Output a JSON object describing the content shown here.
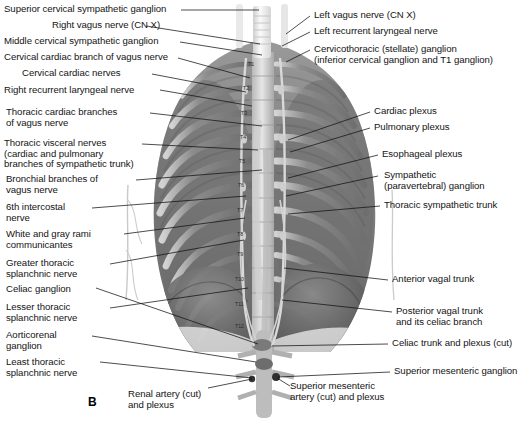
{
  "figure": {
    "panel_label": "B",
    "background_color": "#ffffff",
    "ink_color": "#141414",
    "art_type": "grayscale-anatomical-illustration"
  },
  "labels_left": [
    {
      "id": "superior-cervical-sympathetic-ganglion",
      "lines": [
        "Superior cervical sympathetic ganglion"
      ]
    },
    {
      "id": "right-vagus-nerve",
      "lines": [
        "Right vagus nerve (CN X)"
      ]
    },
    {
      "id": "middle-cervical-sympathetic-ganglion",
      "lines": [
        "Middle cervical sympathetic ganglion"
      ]
    },
    {
      "id": "cervical-cardiac-branch-of-vagus-nerve",
      "lines": [
        "Cervical cardiac branch of vagus nerve"
      ]
    },
    {
      "id": "cervical-cardiac-nerves",
      "lines": [
        "Cervical cardiac nerves"
      ]
    },
    {
      "id": "right-recurrent-laryngeal-nerve",
      "lines": [
        "Right recurrent laryngeal nerve"
      ]
    },
    {
      "id": "thoracic-cardiac-branches-of-vagus-nerve",
      "lines": [
        "Thoracic cardiac branches",
        "of vagus nerve"
      ]
    },
    {
      "id": "thoracic-visceral-nerves",
      "lines": [
        "Thoracic visceral nerves",
        "(cardiac and pulmonary",
        "branches of sympathetic trunk)"
      ]
    },
    {
      "id": "bronchial-branches-of-vagus-nerve",
      "lines": [
        "Bronchial branches of",
        "vagus nerve"
      ]
    },
    {
      "id": "sixth-intercostal-nerve",
      "lines": [
        "6th intercostal",
        "nerve"
      ]
    },
    {
      "id": "white-and-gray-rami-communicantes",
      "lines": [
        "White and gray rami",
        "communicantes"
      ]
    },
    {
      "id": "greater-thoracic-splanchnic-nerve",
      "lines": [
        "Greater thoracic",
        "splanchnic nerve"
      ]
    },
    {
      "id": "celiac-ganglion",
      "lines": [
        "Celiac ganglion"
      ]
    },
    {
      "id": "lesser-thoracic-splanchnic-nerve",
      "lines": [
        "Lesser thoracic",
        "splanchnic nerve"
      ]
    },
    {
      "id": "aorticorenal-ganglion",
      "lines": [
        "Aorticorenal",
        "ganglion"
      ]
    },
    {
      "id": "least-thoracic-splanchnic-nerve",
      "lines": [
        "Least thoracic",
        "splanchnic nerve"
      ]
    }
  ],
  "labels_right": [
    {
      "id": "left-vagus-nerve",
      "lines": [
        "Left vagus nerve (CN X)"
      ]
    },
    {
      "id": "left-recurrent-laryngeal-nerve",
      "lines": [
        "Left recurrent laryngeal nerve"
      ]
    },
    {
      "id": "cervicothoracic-stellate-ganglion",
      "lines": [
        "Cervicothoracic (stellate) ganglion",
        "(inferior cervical ganglion and T1 ganglion)"
      ]
    },
    {
      "id": "cardiac-plexus",
      "lines": [
        "Cardiac plexus"
      ]
    },
    {
      "id": "pulmonary-plexus",
      "lines": [
        "Pulmonary plexus"
      ]
    },
    {
      "id": "esophageal-plexus",
      "lines": [
        "Esophageal plexus"
      ]
    },
    {
      "id": "sympathetic-paravertebral-ganglion",
      "lines": [
        "Sympathetic",
        "(paravertebral) ganglion"
      ]
    },
    {
      "id": "thoracic-sympathetic-trunk",
      "lines": [
        "Thoracic sympathetic trunk"
      ]
    },
    {
      "id": "anterior-vagal-trunk",
      "lines": [
        "Anterior vagal trunk"
      ]
    },
    {
      "id": "posterior-vagal-trunk",
      "lines": [
        "Posterior vagal trunk",
        "and its celiac branch"
      ]
    },
    {
      "id": "celiac-trunk-and-plexus",
      "lines": [
        "Celiac trunk and plexus (cut)"
      ]
    },
    {
      "id": "superior-mesenteric-ganglion",
      "lines": [
        "Superior mesenteric ganglion"
      ]
    }
  ],
  "labels_bottom": [
    {
      "id": "renal-artery-cut-and-plexus",
      "lines": [
        "Renal artery (cut)",
        "and plexus"
      ]
    },
    {
      "id": "superior-mesenteric-artery-cut-and-plexus",
      "lines": [
        "Superior mesenteric",
        "artery (cut) and plexus"
      ]
    }
  ],
  "vertebral_levels": [
    {
      "label": "T1",
      "x": 248,
      "y": 66
    },
    {
      "label": "T2",
      "x": 243,
      "y": 90
    },
    {
      "label": "T3",
      "x": 241,
      "y": 115
    },
    {
      "label": "T4",
      "x": 240,
      "y": 139
    },
    {
      "label": "T5",
      "x": 239,
      "y": 163
    },
    {
      "label": "T6",
      "x": 238,
      "y": 187
    },
    {
      "label": "T7",
      "x": 237,
      "y": 212
    },
    {
      "label": "T8",
      "x": 237,
      "y": 236
    },
    {
      "label": "T9",
      "x": 237,
      "y": 256
    },
    {
      "label": "T10",
      "x": 235,
      "y": 281
    },
    {
      "label": "T11",
      "x": 235,
      "y": 306
    },
    {
      "label": "T12",
      "x": 235,
      "y": 328
    }
  ]
}
